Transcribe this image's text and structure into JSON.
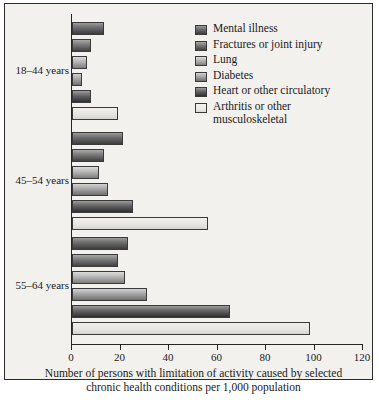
{
  "chart_data": {
    "type": "bar",
    "orientation": "horizontal",
    "title": "",
    "xlabel": "Number of persons with limitation of activity caused by selected chronic health conditions per 1,000 population",
    "ylabel": "",
    "xlim": [
      0,
      120
    ],
    "xticks": [
      0,
      20,
      40,
      60,
      80,
      100,
      120
    ],
    "grid": false,
    "legend_position": "top-right",
    "categories": [
      "18–44 years",
      "45–54 years",
      "55–64 years"
    ],
    "series": [
      {
        "name": "Mental illness",
        "values": [
          13,
          21,
          23
        ]
      },
      {
        "name": "Fractures or joint injury",
        "values": [
          8,
          13,
          19
        ]
      },
      {
        "name": "Lung",
        "values": [
          6,
          11,
          22
        ]
      },
      {
        "name": "Diabetes",
        "values": [
          4,
          15,
          31
        ]
      },
      {
        "name": "Heart or other circulatory",
        "values": [
          8,
          25,
          65
        ]
      },
      {
        "name": "Arthritis or other musculoskeletal",
        "values": [
          19,
          56,
          98
        ]
      }
    ]
  },
  "legend": {
    "items": [
      {
        "label": "Mental illness"
      },
      {
        "label": "Fractures or joint injury"
      },
      {
        "label": "Lung"
      },
      {
        "label": "Diabetes"
      },
      {
        "label": "Heart or other circulatory"
      },
      {
        "label": "Arthritis or other musculoskeletal"
      }
    ]
  },
  "axis": {
    "tick_labels": [
      "0",
      "20",
      "40",
      "60",
      "80",
      "100",
      "120"
    ]
  },
  "caption": {
    "line1": "Number of persons with limitation of activity caused by selected",
    "line2": "chronic health conditions per 1,000 population"
  }
}
